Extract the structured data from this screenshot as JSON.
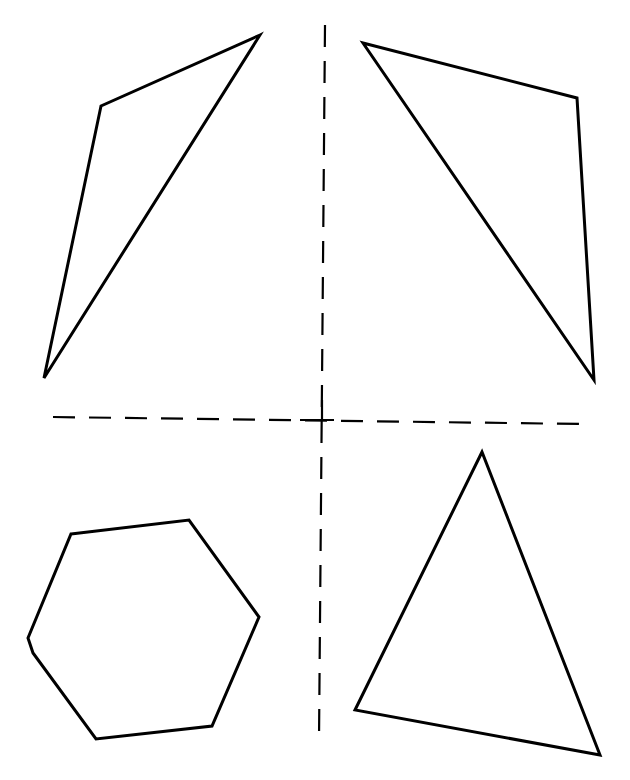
{
  "figure": {
    "width": 630,
    "height": 780,
    "background": "#ffffff",
    "stroke_color": "#000000"
  },
  "axes": {
    "horizontal": {
      "x1": 53,
      "y1": 417,
      "x2": 582,
      "y2": 424,
      "style": "dashed"
    },
    "vertical": {
      "x1": 325,
      "y1": 25,
      "x2": 319,
      "y2": 740,
      "style": "dashed"
    }
  },
  "shapes": [
    {
      "name": "top-left-triangle",
      "type": "triangle",
      "points": "260,35 101,106 44,378"
    },
    {
      "name": "top-right-triangle",
      "type": "triangle",
      "points": "363,43 577,98 594,380"
    },
    {
      "name": "bottom-left-hexagon",
      "type": "hexagon",
      "points": "71,534 189,520 259,617 212,726 96,739 33,653 28,638"
    },
    {
      "name": "bottom-right-triangle",
      "type": "triangle",
      "points": "482,452 355,710 600,755"
    }
  ]
}
